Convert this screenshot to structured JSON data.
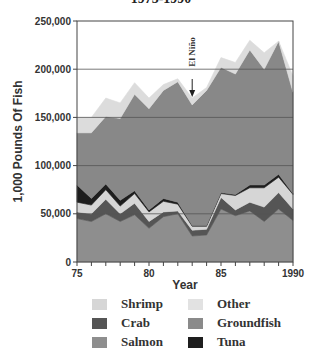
{
  "chart_data": {
    "type": "area",
    "stacked": true,
    "title": "1975-1990",
    "xlabel": "Year",
    "ylabel": "1,000 Pounds Of Fish",
    "x": [
      1975,
      1976,
      1977,
      1978,
      1979,
      1980,
      1981,
      1982,
      1983,
      1984,
      1985,
      1986,
      1987,
      1988,
      1989,
      1990
    ],
    "x_tick_labels": [
      "75",
      "80",
      "85",
      "1990"
    ],
    "y_tick_labels": [
      "0",
      "50,000",
      "100,000",
      "150,000",
      "200,000",
      "250,000"
    ],
    "ylim": [
      0,
      250000
    ],
    "grid": "horizontal",
    "series": [
      {
        "name": "Salmon",
        "color": "#8e8e8e",
        "values": [
          45000,
          42000,
          50000,
          42000,
          49000,
          35000,
          47000,
          50000,
          27000,
          28000,
          55000,
          48000,
          53000,
          42000,
          55000,
          43000
        ]
      },
      {
        "name": "Crab",
        "color": "#555555",
        "values": [
          7000,
          8000,
          15000,
          8000,
          12000,
          7000,
          5000,
          3000,
          6000,
          6000,
          12000,
          6000,
          9000,
          15000,
          17000,
          12000
        ]
      },
      {
        "name": "Shrimp",
        "color": "#d6d6d6",
        "values": [
          10000,
          9000,
          10000,
          8000,
          10000,
          10000,
          11000,
          7000,
          4000,
          3000,
          4000,
          15000,
          15000,
          20000,
          16000,
          15000
        ]
      },
      {
        "name": "Tuna",
        "color": "#1e1e1e",
        "values": [
          18000,
          7000,
          6000,
          6000,
          3000,
          2000,
          3000,
          2000,
          1000,
          1000,
          1000,
          1000,
          3000,
          3000,
          3000,
          1000
        ]
      },
      {
        "name": "Groundfish",
        "color": "#888888",
        "values": [
          54000,
          68000,
          70000,
          85000,
          100000,
          105000,
          112000,
          125000,
          125000,
          140000,
          130000,
          125000,
          140000,
          120000,
          138000,
          105000
        ]
      },
      {
        "name": "Other",
        "color": "#dcdcdc",
        "values": [
          16000,
          16000,
          19000,
          16000,
          12000,
          11000,
          6000,
          3000,
          7000,
          3000,
          10000,
          12000,
          10000,
          17000,
          0,
          17000
        ]
      }
    ],
    "annotations": [
      {
        "text": "El Niño",
        "x": 1983,
        "type": "arrow-down"
      }
    ],
    "legend_position": "bottom"
  },
  "title": "1975-1990",
  "annotation": "El Niño",
  "legend": [
    {
      "label": "Shrimp",
      "color": "#d6d6d6"
    },
    {
      "label": "Other",
      "color": "#e2e2e2"
    },
    {
      "label": "Crab",
      "color": "#555555"
    },
    {
      "label": "Groundfish",
      "color": "#8a8a8a"
    },
    {
      "label": "Salmon",
      "color": "#8e8e8e"
    },
    {
      "label": "Tuna",
      "color": "#1e1e1e"
    }
  ]
}
